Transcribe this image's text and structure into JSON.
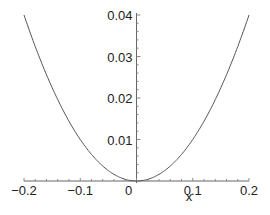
{
  "chart_data": {
    "type": "line",
    "title": "",
    "xlabel": "x",
    "ylabel": "",
    "function": "x^2",
    "xlim": [
      -0.2,
      0.2
    ],
    "ylim": [
      0,
      0.04
    ],
    "grid": false,
    "legend": null,
    "x_ticks": [
      "-0.2",
      "-0.1",
      "0",
      "0.1",
      "0.2"
    ],
    "y_ticks": [
      "0.01",
      "0.02",
      "0.03",
      "0.04"
    ],
    "series": [
      {
        "name": "x^2",
        "color": "#555555",
        "x": [
          -0.2,
          -0.18,
          -0.16,
          -0.14,
          -0.12,
          -0.1,
          -0.08,
          -0.06,
          -0.04,
          -0.02,
          0,
          0.02,
          0.04,
          0.06,
          0.08,
          0.1,
          0.12,
          0.14,
          0.16,
          0.18,
          0.2
        ],
        "y": [
          0.04,
          0.0324,
          0.0256,
          0.0196,
          0.0144,
          0.01,
          0.0064,
          0.0036,
          0.0016,
          0.0004,
          0,
          0.0004,
          0.0016,
          0.0036,
          0.0064,
          0.01,
          0.0144,
          0.0196,
          0.0256,
          0.0324,
          0.04
        ]
      }
    ]
  }
}
